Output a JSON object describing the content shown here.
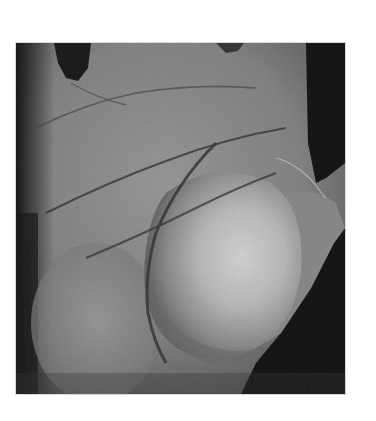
{
  "figure": {
    "rendering": "grayscale clinical photograph",
    "colors": {
      "background": "#ffffff",
      "skin_mid": "#8a8a8a",
      "skin_light": "#b4b4b4",
      "swelling_highlight": "#d2d2d2",
      "shadow": "#1e1e1e",
      "crease": "#3e3e3e"
    }
  }
}
